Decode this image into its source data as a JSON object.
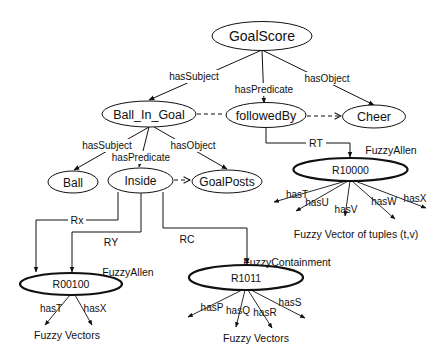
{
  "diagram": {
    "nodes": {
      "goalscore": "GoalScore",
      "ball_in_goal": "Ball_In_Goal",
      "followedby": "followedBy",
      "cheer": "Cheer",
      "ball": "Ball",
      "inside": "Inside",
      "goalposts": "GoalPosts",
      "r10000": "R10000",
      "r00100": "R00100",
      "r1011": "R1011"
    },
    "edges": {
      "gs_subject": "hasSubject",
      "gs_predicate": "hasPredicate",
      "gs_object": "hasObject",
      "big_subject": "hasSubject",
      "big_predicate": "hasPredicate",
      "big_object": "hasObject",
      "rt": "RT",
      "rx": "Rx",
      "ry": "RY",
      "rc": "RC"
    },
    "relation_types": {
      "r10000": "FuzzyAllen",
      "r00100": "FuzzyAllen",
      "r1011": "FuzzyContainment"
    },
    "r10000_props": [
      "hasT",
      "hasU",
      "hasV",
      "hasW",
      "hasX"
    ],
    "r00100_props": [
      "hasT",
      "hasX"
    ],
    "r1011_props": [
      "hasP",
      "hasQ",
      "hasR",
      "hasS"
    ],
    "captions": {
      "r10000": "Fuzzy Vector of tuples (t,v)",
      "r00100": "Fuzzy Vectors",
      "r1011": "Fuzzy Vectors"
    },
    "colors": {
      "stroke": "#111111",
      "background": "#ffffff"
    }
  }
}
